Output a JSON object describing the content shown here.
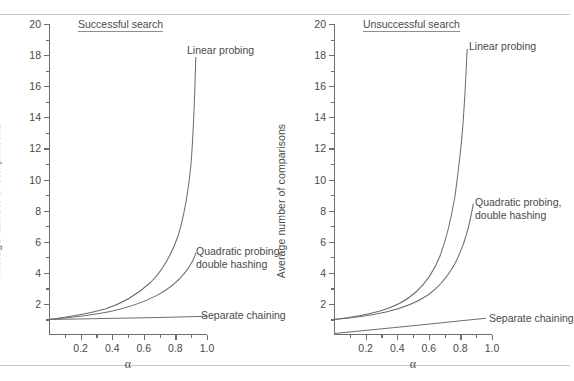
{
  "document": {
    "running_head": "",
    "rules": [
      "top-rule",
      "bottom-rule"
    ]
  },
  "panels": [
    {
      "id": "successful-search",
      "title": "Successful search",
      "ylabel": "Average number of comparisons",
      "xlabel": "α",
      "annotations": [
        {
          "id": "linear-probing",
          "text": "Linear probing"
        },
        {
          "id": "quadratic-probing",
          "line1": "Quadratic probing,",
          "line2": "double hashing"
        },
        {
          "id": "separate-chaining",
          "text": "Separate chaining"
        }
      ]
    },
    {
      "id": "unsuccessful-search",
      "title": "Unsuccessful search",
      "ylabel": "Average number of comparisons",
      "xlabel": "α",
      "annotations": [
        {
          "id": "linear-probing",
          "text": "Linear probing"
        },
        {
          "id": "quadratic-probing",
          "line1": "Quadratic probing,",
          "line2": "double hashing"
        },
        {
          "id": "separate-chaining",
          "text": "Separate chaining"
        }
      ]
    }
  ],
  "chart_data": [
    {
      "type": "line",
      "title": "Successful search",
      "xlabel": "α",
      "ylabel": "Average number of comparisons",
      "xlim": [
        0,
        1.0
      ],
      "ylim": [
        0,
        20
      ],
      "xticks": [
        0.2,
        0.4,
        0.6,
        0.8,
        1.0
      ],
      "xtick_labels": [
        "0.2",
        "0.4",
        "0.6",
        "0.8",
        "1.0"
      ],
      "xminor_step": 0.1,
      "yticks": [
        2,
        4,
        6,
        8,
        10,
        12,
        14,
        16,
        18,
        20
      ],
      "ytick_labels": [
        "2",
        "4",
        "6",
        "8",
        "10",
        "12",
        "14",
        "16",
        "18",
        "20"
      ],
      "yminor_step": 1,
      "grid": false,
      "legend": "inline-annotations",
      "x": [
        0.0,
        0.1,
        0.2,
        0.3,
        0.4,
        0.5,
        0.6,
        0.7,
        0.75,
        0.8,
        0.85,
        0.9
      ],
      "series": [
        {
          "name": "Linear probing",
          "formula": "0.5*(1 + 1/(1-a))",
          "values": [
            1.0,
            1.06,
            1.13,
            1.21,
            1.33,
            1.5,
            1.75,
            2.17,
            2.5,
            3.0,
            3.83,
            5.5
          ],
          "note": "curve drawn rising steeply to ~10 near alpha = 0.9"
        },
        {
          "name": "Quadratic probing, double hashing",
          "formula": "-ln(1-a)/a",
          "values": [
            1.0,
            1.05,
            1.12,
            1.19,
            1.28,
            1.39,
            1.53,
            1.72,
            1.85,
            2.01,
            2.23,
            2.56
          ],
          "note": "reaches about 3.2 at alpha = 0.9"
        },
        {
          "name": "Separate chaining",
          "formula": "1 + a/2",
          "values": [
            1.0,
            1.05,
            1.1,
            1.15,
            1.2,
            1.25,
            1.3,
            1.35,
            1.38,
            1.4,
            1.43,
            1.45
          ],
          "note": "nearly flat just above 1"
        }
      ]
    },
    {
      "type": "line",
      "title": "Unsuccessful search",
      "xlabel": "α",
      "ylabel": "Average number of comparisons",
      "xlim": [
        0,
        1.0
      ],
      "ylim": [
        0,
        20
      ],
      "xticks": [
        0.2,
        0.4,
        0.6,
        0.8,
        1.0
      ],
      "xtick_labels": [
        "0.2",
        "0.4",
        "0.6",
        "0.8",
        "1.0"
      ],
      "xminor_step": 0.1,
      "yticks": [
        2,
        4,
        6,
        8,
        10,
        12,
        14,
        16,
        18,
        20
      ],
      "ytick_labels": [
        "2",
        "4",
        "6",
        "8",
        "10",
        "12",
        "14",
        "16",
        "18",
        "20"
      ],
      "yminor_step": 1,
      "grid": false,
      "legend": "inline-annotations",
      "x": [
        0.0,
        0.1,
        0.2,
        0.3,
        0.4,
        0.5,
        0.6,
        0.7,
        0.75,
        0.8,
        0.85,
        0.9
      ],
      "series": [
        {
          "name": "Linear probing",
          "formula": "0.5*(1 + 1/(1-a)^2)",
          "values": [
            1.0,
            1.12,
            1.28,
            1.52,
            1.89,
            2.5,
            3.63,
            6.06,
            8.5,
            13.0,
            22.7,
            50.5
          ],
          "note": "clipped by plot box; reaches ~18.3 at right end of drawn curve near alpha = 0.88"
        },
        {
          "name": "Quadratic probing, double hashing",
          "formula": "1/(1-a)",
          "values": [
            1.0,
            1.11,
            1.25,
            1.43,
            1.67,
            2.0,
            2.5,
            3.33,
            4.0,
            5.0,
            6.67,
            10.0
          ],
          "note": "drawn up to about 6.3 at alpha = 0.9"
        },
        {
          "name": "Separate chaining",
          "formula": "a",
          "values": [
            0.0,
            0.1,
            0.2,
            0.3,
            0.4,
            0.5,
            0.6,
            0.7,
            0.75,
            0.8,
            0.85,
            0.9
          ],
          "note": "straight line from origin, reaching ~0.9"
        }
      ]
    }
  ]
}
